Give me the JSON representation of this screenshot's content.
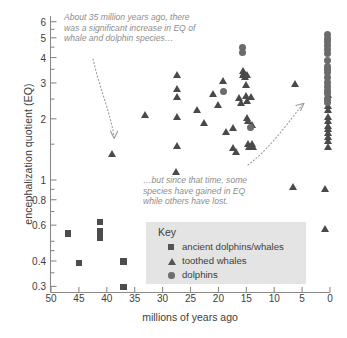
{
  "chart_data": {
    "type": "scatter",
    "title": "",
    "xlabel": "millions of years ago",
    "ylabel": "encephalization quotient (EQ)",
    "xlim": [
      50,
      0
    ],
    "ylim": [
      0.28,
      6.4
    ],
    "x_axis_reversed": true,
    "y_axis_scale": "log",
    "grid": false,
    "xticks": [
      50,
      45,
      40,
      35,
      30,
      25,
      20,
      15,
      10,
      5,
      0
    ],
    "xtick_labels": [
      "50",
      "45",
      "40",
      "35",
      "30",
      "25",
      "20",
      "15",
      "10",
      "5",
      "0"
    ],
    "yticks": [
      6,
      5,
      4,
      3,
      2,
      1,
      0.8,
      0.6,
      0.4,
      0.3
    ],
    "ytick_labels": [
      "6",
      "5",
      "4",
      "3",
      "2",
      "1",
      "0.8",
      "0.6",
      "0.4",
      "0.3"
    ],
    "legend_position": "inside-center-bottom",
    "legend_title": "Key",
    "series": [
      {
        "name": "ancient dolphins/whales",
        "marker": "square",
        "color": "#4c4c4c",
        "points": [
          [
            47.0,
            0.545
          ],
          [
            45.0,
            0.39
          ],
          [
            41.2,
            0.62
          ],
          [
            41.2,
            0.56
          ],
          [
            41.2,
            0.54
          ],
          [
            41.2,
            0.52
          ],
          [
            37.0,
            0.398
          ],
          [
            37.0,
            0.297
          ]
        ]
      },
      {
        "name": "toothed whales",
        "marker": "triangle",
        "color": "#4a4a4a",
        "points": [
          [
            39.0,
            1.35
          ],
          [
            33.2,
            2.08
          ],
          [
            27.4,
            3.3
          ],
          [
            27.4,
            2.8
          ],
          [
            27.4,
            2.55
          ],
          [
            27.4,
            2.04
          ],
          [
            27.4,
            1.47
          ],
          [
            27.6,
            1.1
          ],
          [
            23.8,
            2.22
          ],
          [
            22.6,
            1.9
          ],
          [
            21.0,
            2.66
          ],
          [
            20.0,
            2.35
          ],
          [
            19.2,
            3.08
          ],
          [
            18.6,
            1.72
          ],
          [
            17.4,
            1.8
          ],
          [
            17.3,
            1.43
          ],
          [
            16.8,
            1.37
          ],
          [
            16.2,
            2.52
          ],
          [
            16.0,
            2.38
          ],
          [
            15.6,
            3.42
          ],
          [
            15.6,
            3.28
          ],
          [
            15.4,
            3.36
          ],
          [
            15.2,
            3.22
          ],
          [
            15.0,
            2.93
          ],
          [
            15.0,
            2.6
          ],
          [
            14.9,
            2.44
          ],
          [
            14.8,
            2.02
          ],
          [
            14.6,
            1.96
          ],
          [
            14.6,
            1.5
          ],
          [
            14.4,
            1.46
          ],
          [
            14.8,
            3.3
          ],
          [
            14.2,
            2.55
          ],
          [
            13.9,
            1.86
          ],
          [
            13.9,
            1.5
          ],
          [
            13.8,
            1.45
          ],
          [
            6.2,
            2.95
          ],
          [
            6.6,
            0.92
          ],
          [
            0.9,
            0.9
          ],
          [
            0.8,
            0.575
          ],
          [
            0.4,
            2.3
          ],
          [
            0.4,
            2.2
          ],
          [
            0.4,
            2.05
          ],
          [
            0.4,
            1.95
          ],
          [
            0.4,
            1.85
          ],
          [
            0.4,
            1.78
          ],
          [
            0.4,
            1.7
          ],
          [
            0.4,
            1.62
          ],
          [
            0.4,
            1.55
          ],
          [
            0.4,
            1.45
          ],
          [
            0.4,
            2.62
          ]
        ]
      },
      {
        "name": "dolphins",
        "marker": "circle",
        "color": "#6b6b6b",
        "points": [
          [
            19.0,
            2.73
          ],
          [
            15.6,
            4.5
          ],
          [
            15.6,
            4.22
          ],
          [
            14.2,
            1.82
          ],
          [
            0.4,
            5.2
          ],
          [
            0.4,
            4.95
          ],
          [
            0.4,
            4.78
          ],
          [
            0.4,
            4.6
          ],
          [
            0.4,
            4.4
          ],
          [
            0.4,
            4.18
          ],
          [
            0.4,
            3.88
          ],
          [
            0.4,
            3.62
          ],
          [
            0.4,
            3.5
          ],
          [
            0.4,
            3.38
          ],
          [
            0.4,
            3.18
          ],
          [
            0.4,
            3.0
          ],
          [
            0.4,
            2.88
          ],
          [
            0.4,
            2.76
          ],
          [
            0.4,
            2.66
          ],
          [
            0.4,
            2.5
          ],
          [
            0.4,
            2.4
          ]
        ]
      }
    ],
    "annotations": [
      {
        "id": "annot-top",
        "text": "About 35 million years ago, there was a significant increase in EQ of whale and dolphin species…"
      },
      {
        "id": "annot-mid",
        "text": "…but since that time, some species have gained in EQ while others have lost."
      }
    ]
  },
  "legend": {
    "title": "Key",
    "entries": [
      {
        "label": "ancient dolphins/whales",
        "marker": "square-icon"
      },
      {
        "label": "toothed whales",
        "marker": "triangle-icon"
      },
      {
        "label": "dolphins",
        "marker": "circle-icon"
      }
    ]
  },
  "axes": {
    "x_title": "millions of years ago",
    "y_title": "encephalization quotient (EQ)"
  },
  "colors": {
    "axis": "#8a8a8a",
    "text": "#3d3d3d",
    "annotation": "#8d8d8d",
    "legend_bg": "#e4e4e4",
    "marker_square": "#4c4c4c",
    "marker_triangle": "#4a4a4a",
    "marker_circle": "#6b6b6b",
    "background": "#ffffff"
  }
}
